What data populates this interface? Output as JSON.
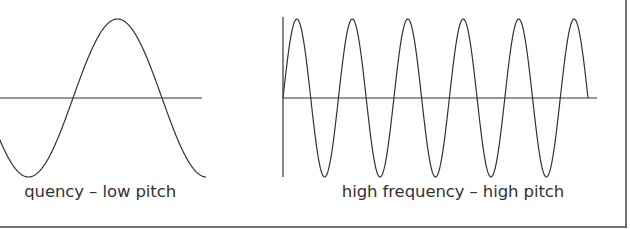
{
  "panels": [
    {
      "name": "low-frequency",
      "caption": "low frequency – low pitch",
      "caption_visible": "quency – low pitch",
      "cycles_shown": 1.25,
      "frequency": "low",
      "pitch": "low"
    },
    {
      "name": "high-frequency",
      "caption": "high frequency – high pitch",
      "cycles_shown": 5.5,
      "frequency": "high",
      "pitch": "high"
    }
  ],
  "colors": {
    "line": "#333333",
    "frame": "#444444",
    "background": "#ffffff"
  }
}
